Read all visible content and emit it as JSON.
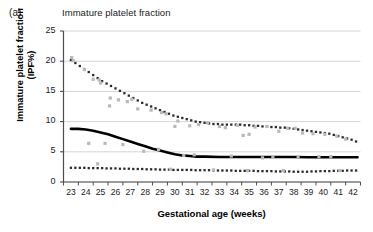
{
  "panel_label": "(a)",
  "chart_data": {
    "type": "scatter",
    "title": "Immature platelet fraction",
    "xlabel": "Gestational age (weeks)",
    "ylabel": "Immature platelet fraction (IPF%)",
    "ylabel_line1": "Immature platelet fraction",
    "ylabel_line2": "(IPF%)",
    "xlim": [
      22.5,
      42.5
    ],
    "ylim": [
      0,
      25
    ],
    "yticks": [
      0,
      5,
      10,
      15,
      20,
      25
    ],
    "xticks": [
      23,
      24,
      25,
      26,
      27,
      28,
      29,
      30,
      31,
      32,
      33,
      34,
      35,
      36,
      37,
      38,
      39,
      40,
      41,
      42
    ],
    "grid": true,
    "legend": "none",
    "colors": {
      "upper_centile": "#2b2b2b",
      "median": "#000000",
      "lower_centile": "#2b2b2b",
      "observations": "#b9b9b9",
      "gridline": "#c9c9c9",
      "axis": "#4d4d4d"
    },
    "series": [
      {
        "name": "Upper centile (97th)",
        "style": "dotted-markers",
        "color": "#2b2b2b",
        "x": [
          23.0,
          23.3,
          23.6,
          23.9,
          24.2,
          24.5,
          24.8,
          25.1,
          25.4,
          25.7,
          26.0,
          26.3,
          26.6,
          26.9,
          27.2,
          27.5,
          27.8,
          28.1,
          28.4,
          28.7,
          29.0,
          29.3,
          29.6,
          29.9,
          30.2,
          30.5,
          30.8,
          31.1,
          31.4,
          31.7,
          32.0,
          32.3,
          32.6,
          32.9,
          33.2,
          33.5,
          33.8,
          34.1,
          34.4,
          34.7,
          35.0,
          35.3,
          35.6,
          35.9,
          36.2,
          36.5,
          36.8,
          37.1,
          37.4,
          37.7,
          38.0,
          38.3,
          38.6,
          38.9,
          39.2,
          39.5,
          39.8,
          40.1,
          40.4,
          40.7,
          41.0,
          41.3,
          41.6,
          41.9,
          42.2
        ],
        "y": [
          20.2,
          19.7,
          19.2,
          18.7,
          18.2,
          17.7,
          17.2,
          16.7,
          16.3,
          15.9,
          15.5,
          15.1,
          14.7,
          14.3,
          13.9,
          13.5,
          13.1,
          12.8,
          12.5,
          12.2,
          11.9,
          11.6,
          11.3,
          11.0,
          10.8,
          10.6,
          10.4,
          10.2,
          10.0,
          9.9,
          9.8,
          9.7,
          9.6,
          9.6,
          9.5,
          9.5,
          9.5,
          9.5,
          9.5,
          9.4,
          9.4,
          9.3,
          9.3,
          9.2,
          9.2,
          9.1,
          9.1,
          9.0,
          9.0,
          8.9,
          8.8,
          8.7,
          8.6,
          8.5,
          8.4,
          8.3,
          8.2,
          8.1,
          8.0,
          7.8,
          7.6,
          7.4,
          7.2,
          7.0,
          6.7
        ]
      },
      {
        "name": "Median (50th)",
        "style": "solid-line",
        "color": "#000000",
        "x": [
          23.0,
          23.5,
          24.0,
          24.5,
          25.0,
          25.5,
          26.0,
          26.5,
          27.0,
          27.5,
          28.0,
          28.5,
          29.0,
          29.5,
          30.0,
          30.5,
          31.0,
          31.5,
          32.0,
          33.0,
          34.0,
          35.0,
          36.0,
          37.0,
          38.0,
          39.0,
          40.0,
          41.0,
          42.0,
          42.3
        ],
        "y": [
          8.8,
          8.8,
          8.7,
          8.5,
          8.2,
          7.9,
          7.5,
          7.1,
          6.7,
          6.3,
          5.9,
          5.5,
          5.2,
          4.9,
          4.6,
          4.4,
          4.3,
          4.2,
          4.2,
          4.15,
          4.15,
          4.15,
          4.15,
          4.15,
          4.15,
          4.1,
          4.1,
          4.1,
          4.1,
          4.1
        ]
      },
      {
        "name": "Lower centile (3rd)",
        "style": "dotted-markers",
        "color": "#2b2b2b",
        "x": [
          23.0,
          23.3,
          23.6,
          23.9,
          24.2,
          24.5,
          24.8,
          25.1,
          25.4,
          25.7,
          26.0,
          26.3,
          26.6,
          26.9,
          27.2,
          27.5,
          27.8,
          28.1,
          28.4,
          28.7,
          29.0,
          29.3,
          29.6,
          29.9,
          30.2,
          30.5,
          30.8,
          31.1,
          31.4,
          31.7,
          32.0,
          32.3,
          32.6,
          32.9,
          33.2,
          33.5,
          33.8,
          34.1,
          34.4,
          34.7,
          35.0,
          35.3,
          35.6,
          35.9,
          36.2,
          36.5,
          36.8,
          37.1,
          37.4,
          37.7,
          38.0,
          38.3,
          38.6,
          38.9,
          39.2,
          39.5,
          39.8,
          40.1,
          40.4,
          40.7,
          41.0,
          41.3,
          41.6,
          41.9,
          42.2
        ],
        "y": [
          2.35,
          2.35,
          2.35,
          2.35,
          2.3,
          2.3,
          2.3,
          2.3,
          2.25,
          2.25,
          2.25,
          2.2,
          2.2,
          2.2,
          2.15,
          2.15,
          2.15,
          2.1,
          2.1,
          2.1,
          2.05,
          2.05,
          2.05,
          2.0,
          2.0,
          2.0,
          2.0,
          2.0,
          1.95,
          1.95,
          1.95,
          1.95,
          1.9,
          1.9,
          1.9,
          1.9,
          1.9,
          1.85,
          1.85,
          1.85,
          1.85,
          1.85,
          1.8,
          1.8,
          1.8,
          1.8,
          1.75,
          1.75,
          1.75,
          1.75,
          1.7,
          1.7,
          1.7,
          1.7,
          1.75,
          1.75,
          1.8,
          1.8,
          1.8,
          1.85,
          1.85,
          1.85,
          1.9,
          1.9,
          1.9
        ]
      },
      {
        "name": "Individual observations",
        "style": "scatter-markers",
        "color": "#b9b9b9",
        "x": [
          23.05,
          23.15,
          23.9,
          24.5,
          24.9,
          25.0,
          25.6,
          25.65,
          26.2,
          26.8,
          27.1,
          27.5,
          28.4,
          29.1,
          29.4,
          30.0,
          30.2,
          31.0,
          31.6,
          32.2,
          33.0,
          33.4,
          34.2,
          34.6,
          35.0,
          35.4,
          36.2,
          37.0,
          37.6,
          38.1,
          38.6,
          39.3,
          40.1,
          40.9,
          41.5,
          24.2,
          26.5,
          28.9,
          31.3,
          33.8,
          35.9,
          38.3,
          40.5,
          25.3,
          27.9,
          30.6,
          36.6,
          39.7,
          24.8,
          29.7,
          32.6,
          34.9,
          37.3,
          41.1
        ],
        "y": [
          20.6,
          20.1,
          18.6,
          17.0,
          16.9,
          16.4,
          12.6,
          13.9,
          13.6,
          13.3,
          13.7,
          12.1,
          11.9,
          11.5,
          11.3,
          9.2,
          10.1,
          9.3,
          9.5,
          9.8,
          9.2,
          9.0,
          9.4,
          7.7,
          7.9,
          9.1,
          9.2,
          8.4,
          8.9,
          8.9,
          8.1,
          8.0,
          7.9,
          7.6,
          7.1,
          6.4,
          6.2,
          5.4,
          4.5,
          4.3,
          4.0,
          4.2,
          4.2,
          6.4,
          5.1,
          4.4,
          4.2,
          4.2,
          3.0,
          2.1,
          2.0,
          1.9,
          1.9,
          1.9
        ]
      }
    ]
  }
}
